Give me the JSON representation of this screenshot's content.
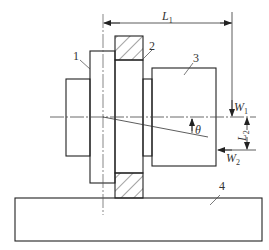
{
  "figure": {
    "type": "technical mechanical drawing",
    "stroke_color": "#222222",
    "background": "#ffffff"
  },
  "parts": [
    {
      "id": "1",
      "label": "1"
    },
    {
      "id": "2",
      "label": "2"
    },
    {
      "id": "3",
      "label": "3"
    },
    {
      "id": "4",
      "label": "4"
    }
  ],
  "dimensions": {
    "L1": {
      "main": "L",
      "sub": "1"
    },
    "L2": {
      "main": "L",
      "sub": "2"
    },
    "W1": {
      "main": "W",
      "sub": "1"
    },
    "W2": {
      "main": "W",
      "sub": "2"
    },
    "theta": "θ"
  }
}
